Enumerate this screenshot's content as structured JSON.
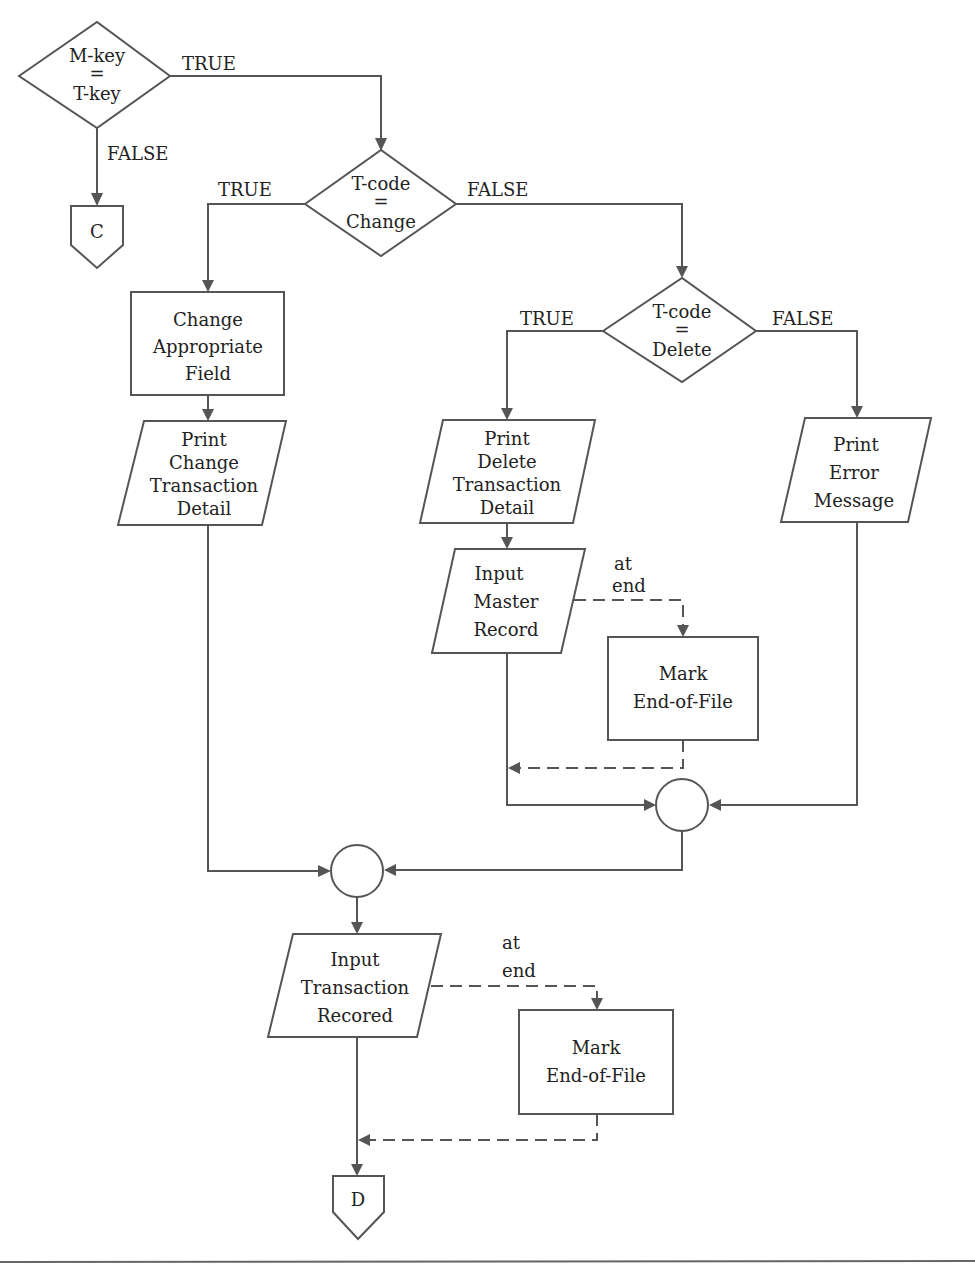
{
  "flowchart": {
    "decisions": {
      "mkey": {
        "line1": "M-key",
        "line2": "=",
        "line3": "T-key"
      },
      "change": {
        "line1": "T-code",
        "line2": "=",
        "line3": "Change"
      },
      "delete": {
        "line1": "T-code",
        "line2": "=",
        "line3": "Delete"
      }
    },
    "processes": {
      "change_field": {
        "line1": "Change",
        "line2": "Appropriate",
        "line3": "Field"
      },
      "mark_eof_master": {
        "line1": "Mark",
        "line2": "End-of-File"
      },
      "mark_eof_transaction": {
        "line1": "Mark",
        "line2": "End-of-File"
      }
    },
    "io": {
      "print_change": {
        "line1": "Print",
        "line2": "Change",
        "line3": "Transaction",
        "line4": "Detail"
      },
      "print_delete": {
        "line1": "Print",
        "line2": "Delete",
        "line3": "Transaction",
        "line4": "Detail"
      },
      "print_error": {
        "line1": "Print",
        "line2": "Error",
        "line3": "Message"
      },
      "input_master": {
        "line1": "Input",
        "line2": "Master",
        "line3": "Record"
      },
      "input_transaction": {
        "line1": "Input",
        "line2": "Transaction",
        "line3": "Recored"
      }
    },
    "connectors": {
      "c": "C",
      "d": "D"
    },
    "branch_labels": {
      "mkey_true": "TRUE",
      "mkey_false": "FALSE",
      "change_true": "TRUE",
      "change_false": "FALSE",
      "delete_true": "TRUE",
      "delete_false": "FALSE",
      "master_at": "at",
      "master_end": "end",
      "trans_at": "at",
      "trans_end": "end"
    }
  }
}
